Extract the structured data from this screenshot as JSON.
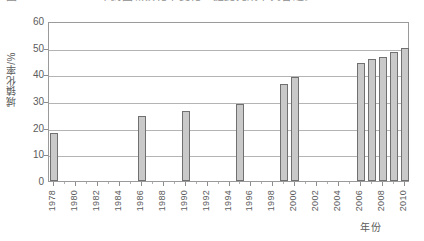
{
  "caption": {
    "text": "图1　1978—2010年我国城镇化率变化　据此完成下列各题。"
  },
  "chart_data": {
    "type": "bar",
    "title": "",
    "xlabel": "年份",
    "ylabel": "城镇化率/%",
    "ylim": [
      0,
      60
    ],
    "yticks": [
      0,
      10,
      20,
      30,
      40,
      50,
      60
    ],
    "xlim": [
      1977.5,
      2010.5
    ],
    "xticks": [
      1978,
      1980,
      1982,
      1984,
      1986,
      1988,
      1990,
      1992,
      1994,
      1996,
      1998,
      2000,
      2002,
      2004,
      2006,
      2008,
      2010
    ],
    "xtick_labels": [
      "1978",
      "1980",
      "1982",
      "1984",
      "1986",
      "1988",
      "1990",
      "1992",
      "1994",
      "1996",
      "1998",
      "2000",
      "2002",
      "2004",
      "2006",
      "2008",
      "2010"
    ],
    "grid": true,
    "legend": "none",
    "bar_fill": "#c9c9c9",
    "bar_edge": "#707070",
    "categories": [
      1978,
      1986,
      1990,
      1995,
      1999,
      2000,
      2006,
      2007,
      2008,
      2009,
      2010
    ],
    "values": [
      17.9,
      24.5,
      26.4,
      29.0,
      36.5,
      39.0,
      44.3,
      45.9,
      46.5,
      48.3,
      50.0
    ],
    "points": [
      {
        "year": "1978",
        "value": 17.9
      },
      {
        "year": "1986",
        "value": 24.5
      },
      {
        "year": "1990",
        "value": 26.4
      },
      {
        "year": "1995",
        "value": 29.0
      },
      {
        "year": "1999",
        "value": 36.5
      },
      {
        "year": "2000",
        "value": 39.0
      },
      {
        "year": "2006",
        "value": 44.3
      },
      {
        "year": "2007",
        "value": 45.9
      },
      {
        "year": "2008",
        "value": 46.5
      },
      {
        "year": "2009",
        "value": 48.3
      },
      {
        "year": "2010",
        "value": 50.0
      }
    ]
  }
}
